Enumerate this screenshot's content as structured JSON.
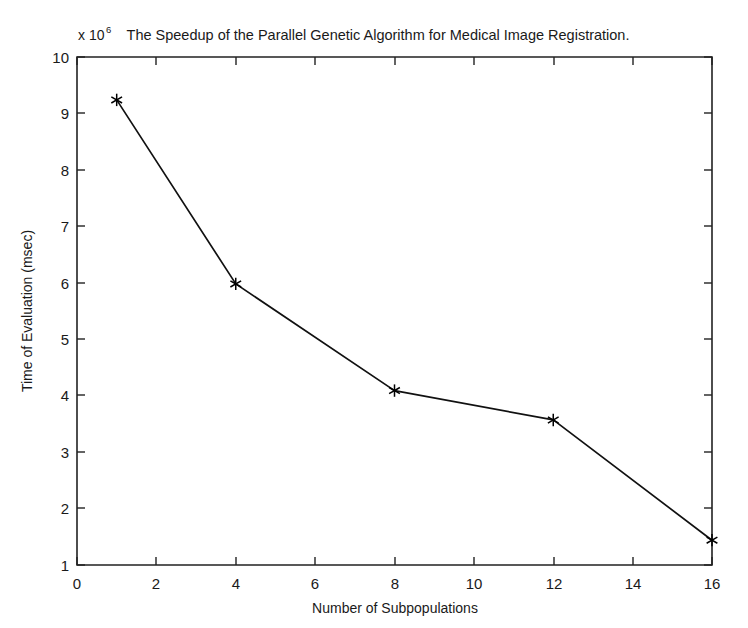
{
  "chart_data": {
    "type": "line",
    "title": "The Speedup of the Parallel Genetic Algorithm for Medical Image Registration.",
    "xlabel": "Number of Subpopulations",
    "ylabel": "Time of Evaluation (msec)",
    "y_multiplier_base": "x 10",
    "y_multiplier_exponent": "6",
    "y_multiplier_value": 1000000,
    "x": [
      1,
      4,
      8,
      12,
      16
    ],
    "values": [
      9.24,
      5.98,
      4.09,
      3.57,
      1.44
    ],
    "values_unscaled": [
      9240000,
      5980000,
      4090000,
      3570000,
      1440000
    ],
    "series": [
      {
        "name": "Time of Evaluation",
        "x": [
          1,
          4,
          8,
          12,
          16
        ],
        "values": [
          9.24,
          5.98,
          4.09,
          3.57,
          1.44
        ]
      }
    ],
    "xlim": [
      0,
      16
    ],
    "ylim": [
      1,
      10
    ],
    "xticks": [
      0,
      2,
      4,
      6,
      8,
      10,
      12,
      14,
      16
    ],
    "yticks": [
      1,
      2,
      3,
      4,
      5,
      6,
      7,
      8,
      9,
      10
    ],
    "xtick_labels": [
      "0",
      "2",
      "4",
      "6",
      "8",
      "10",
      "12",
      "14",
      "16"
    ],
    "ytick_labels": [
      "1",
      "2",
      "3",
      "4",
      "5",
      "6",
      "7",
      "8",
      "9",
      "10"
    ],
    "grid": false,
    "legend": false,
    "marker": "asterisk",
    "line_color": "#111111",
    "marker_color": "#000000",
    "background_color": "#ffffff"
  }
}
